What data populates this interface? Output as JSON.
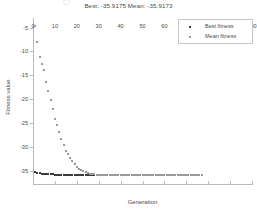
{
  "chart_data": {
    "type": "scatter",
    "title": "Best: -35.9175 Mean: -35.9173",
    "xlabel": "Generation",
    "ylabel": "Fitness value",
    "xlim": [
      0,
      100
    ],
    "ylim": [
      -38,
      -3
    ],
    "grid": false,
    "legend_position": "top-right",
    "xticks": [
      0,
      10,
      20,
      30,
      40,
      50,
      60,
      70,
      80,
      90,
      100
    ],
    "xtick_labels": [
      "0",
      "10",
      "20",
      "30",
      "40",
      "50",
      "60",
      "70",
      "80",
      "90",
      "100"
    ],
    "yticks": [
      -5,
      -10,
      -15,
      -20,
      -25,
      -30,
      -35
    ],
    "ytick_labels": [
      "-5",
      "-10",
      "-15",
      "-20",
      "-25",
      "-30",
      "-35"
    ],
    "best_value": -35.9175,
    "mean_value": -35.9173,
    "series": [
      {
        "name": "Best fitness",
        "marker": "point",
        "color": "#3c3c3c",
        "x": [
          1,
          2,
          3,
          4,
          5,
          6,
          7,
          8,
          9,
          10,
          11,
          12,
          13,
          14,
          15,
          16,
          17,
          18,
          19,
          20,
          21,
          22,
          23,
          24,
          25,
          26,
          27,
          28,
          29,
          30,
          31,
          32,
          33,
          34,
          35,
          36,
          37,
          38,
          39,
          40,
          41,
          42,
          43,
          44,
          45,
          46,
          47,
          48,
          49,
          50,
          51,
          52,
          53,
          54,
          55,
          56,
          57,
          58,
          59,
          60,
          61,
          62,
          63,
          64,
          65,
          66,
          67,
          68,
          69,
          70,
          71,
          72,
          73,
          74,
          75,
          76,
          77
        ],
        "values": [
          -35.2,
          -35.4,
          -35.55,
          -35.6,
          -35.65,
          -35.7,
          -35.72,
          -35.75,
          -35.78,
          -35.8,
          -35.82,
          -35.84,
          -35.86,
          -35.87,
          -35.88,
          -35.89,
          -35.9,
          -35.905,
          -35.91,
          -35.912,
          -35.914,
          -35.915,
          -35.916,
          -35.9165,
          -35.917,
          -35.9172,
          -35.9173,
          -35.9174,
          -35.9175,
          -35.9175,
          -35.9175,
          -35.9175,
          -35.9175,
          -35.9175,
          -35.9175,
          -35.9175,
          -35.9175,
          -35.9175,
          -35.9175,
          -35.9175,
          -35.9175,
          -35.9175,
          -35.9175,
          -35.9175,
          -35.9175,
          -35.9175,
          -35.9175,
          -35.9175,
          -35.9175,
          -35.9175,
          -35.9175,
          -35.9175,
          -35.9175,
          -35.9175,
          -35.9175,
          -35.9175,
          -35.9175,
          -35.9175,
          -35.9175,
          -35.9175,
          -35.9175,
          -35.9175,
          -35.9175,
          -35.9175,
          -35.9175,
          -35.9175,
          -35.9175,
          -35.9175,
          -35.9175,
          -35.9175,
          -35.9175,
          -35.9175,
          -35.9175,
          -35.9175,
          -35.9175,
          -35.9175,
          -35.9175
        ]
      },
      {
        "name": "Mean fitness",
        "marker": "point",
        "color": "#9a9a9a",
        "x": [
          1,
          2,
          3,
          4,
          5,
          6,
          7,
          8,
          9,
          10,
          11,
          12,
          13,
          14,
          15,
          16,
          17,
          18,
          19,
          20,
          21,
          22,
          23,
          24,
          25,
          26,
          27,
          28,
          29,
          30,
          31,
          32,
          33,
          34,
          35,
          36,
          37,
          38,
          39,
          40,
          41,
          42,
          43,
          44,
          45,
          46,
          47,
          48,
          49,
          50,
          51,
          52,
          53,
          54,
          55,
          56,
          57,
          58,
          59,
          60,
          61,
          62,
          63,
          64,
          65,
          66,
          67,
          68,
          69,
          70,
          71,
          72,
          73,
          74,
          75,
          76,
          77
        ],
        "values": [
          -4.6,
          -8.0,
          -11.2,
          -12.6,
          -14.0,
          -16.5,
          -18.3,
          -20.2,
          -22.0,
          -24.1,
          -25.4,
          -26.8,
          -28.4,
          -29.6,
          -30.8,
          -31.6,
          -32.4,
          -33.0,
          -33.6,
          -34.2,
          -34.6,
          -34.9,
          -35.1,
          -35.3,
          -35.45,
          -35.6,
          -35.7,
          -35.78,
          -35.84,
          -35.88,
          -35.9,
          -35.91,
          -35.913,
          -35.915,
          -35.916,
          -35.9165,
          -35.9168,
          -35.917,
          -35.9171,
          -35.9172,
          -35.9172,
          -35.9173,
          -35.9173,
          -35.9173,
          -35.9173,
          -35.9173,
          -35.9173,
          -35.9173,
          -35.9173,
          -35.9173,
          -35.9173,
          -35.9173,
          -35.9173,
          -35.9173,
          -35.9173,
          -35.9173,
          -35.9173,
          -35.9173,
          -35.9173,
          -35.9173,
          -35.9173,
          -35.9173,
          -35.9173,
          -35.9173,
          -35.9173,
          -35.9173,
          -35.9173,
          -35.9173,
          -35.9173,
          -35.9173,
          -35.9173,
          -35.9173,
          -35.9173,
          -35.9173,
          -35.9173,
          -35.9173,
          -35.9173
        ]
      }
    ]
  },
  "legend": {
    "entries": [
      {
        "label": "Best fitness",
        "color": "#3c3c3c"
      },
      {
        "label": "Mean fitness",
        "color": "#9a9a9a"
      }
    ]
  }
}
